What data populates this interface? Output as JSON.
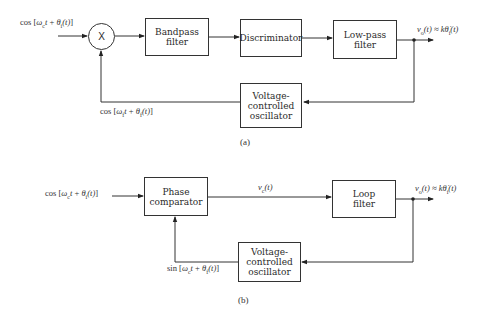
{
  "diagram_a": {
    "input_label": "cos [ω_c t + θ_i(t)]",
    "input_label_parts": {
      "fn": "cos",
      "open": "[",
      "w": "ω",
      "wsub": "c",
      "t": "t",
      "plus": " + ",
      "th": "θ",
      "thsub": "i",
      "arg": "(t)",
      "close": "]"
    },
    "multiplier": "X",
    "blocks": {
      "bandpass": {
        "line1": "Bandpass",
        "line2": "filter"
      },
      "discriminator": {
        "line1": "Discriminator"
      },
      "lowpass": {
        "line1": "Low-pass",
        "line2": "filter"
      },
      "vco": {
        "line1": "Voltage-",
        "line2": "controlled",
        "line3": "oscillator"
      }
    },
    "output_label": "v_o(t) ≈ kθ̇_i(t)",
    "output_parts": {
      "v": "v",
      "vsub": "o",
      "arg": "(t) ≈ k",
      "th": "θ̇",
      "thsub": "i",
      "arg2": "(t)"
    },
    "feedback_label": "cos [ω_f t + θ_f(t)]",
    "feedback_parts": {
      "fn": "cos",
      "open": "[",
      "w": "ω",
      "wsub": "f",
      "t": "t",
      "plus": " + ",
      "th": "θ",
      "thsub": "f",
      "arg": "(t)",
      "close": "]"
    },
    "caption": "(a)"
  },
  "diagram_b": {
    "input_label": "cos [ω_c t + θ_i(t)]",
    "input_parts": {
      "fn": "cos",
      "open": "[",
      "w": "ω",
      "wsub": "c",
      "t": "t",
      "plus": " + ",
      "th": "θ",
      "thsub": "i",
      "arg": "(t)",
      "close": "]"
    },
    "blocks": {
      "phase_comparator": {
        "line1": "Phase",
        "line2": "comparator"
      },
      "loop_filter": {
        "line1": "Loop",
        "line2": "filter"
      },
      "vco": {
        "line1": "Voltage-",
        "line2": "controlled",
        "line3": "oscillator"
      }
    },
    "control_label": "v_c(t)",
    "control_parts": {
      "v": "v",
      "vsub": "c",
      "arg": "(t)"
    },
    "output_label": "v_o(t) ≈ kθ̇_i(t)",
    "output_parts": {
      "v": "v",
      "vsub": "o",
      "arg": "(t) ≈ k",
      "th": "θ̇",
      "thsub": "i",
      "arg2": "(t)"
    },
    "feedback_label": "sin [ω_c t + θ_f(t)]",
    "feedback_parts": {
      "fn": "sin",
      "open": "[",
      "w": "ω",
      "wsub": "c",
      "t": "t",
      "plus": " + ",
      "th": "θ",
      "thsub": "f",
      "arg": "(t)",
      "close": "]"
    },
    "caption": "(b)"
  }
}
